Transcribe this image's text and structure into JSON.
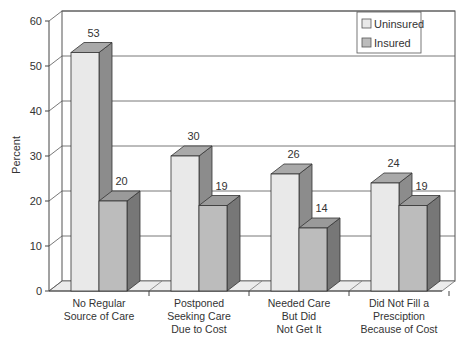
{
  "chart_data": {
    "type": "bar",
    "style": "3d-clustered",
    "title": "",
    "xlabel": "",
    "ylabel": "Percent",
    "ylim": [
      0,
      60
    ],
    "yticks": [
      0,
      10,
      20,
      30,
      40,
      50,
      60
    ],
    "grid": true,
    "legend_position": "top-right",
    "categories": [
      [
        "No Regular",
        "Source of Care"
      ],
      [
        "Postponed",
        "Seeking Care",
        "Due to Cost"
      ],
      [
        "Needed Care",
        "But Did",
        "Not Get It"
      ],
      [
        "Did Not Fill a",
        "Presciption",
        "Because of Cost"
      ]
    ],
    "series": [
      {
        "name": "Uninsured",
        "values": [
          53,
          30,
          26,
          24
        ],
        "colors": {
          "front": "#e9e9e9",
          "top": "#a9a9a9",
          "side": "#8c8c8c"
        }
      },
      {
        "name": "Insured",
        "values": [
          20,
          19,
          14,
          19
        ],
        "colors": {
          "front": "#bcbcbc",
          "top": "#9a9a9a",
          "side": "#777777"
        }
      }
    ]
  }
}
